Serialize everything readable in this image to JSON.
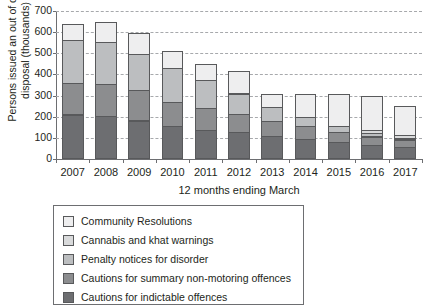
{
  "chart_data": {
    "type": "bar",
    "subtype": "stacked-vertical",
    "title": "",
    "xlabel": "12 months ending March",
    "ylabel": "Persons issued an out of court disposal (thousands)",
    "categories": [
      "2007",
      "2008",
      "2009",
      "2010",
      "2011",
      "2012",
      "2013",
      "2014",
      "2015",
      "2016",
      "2017"
    ],
    "ylim": [
      0,
      700
    ],
    "yticks": [
      0,
      100,
      200,
      300,
      400,
      500,
      600,
      700
    ],
    "ytick_labels": [
      "0",
      "100",
      "200",
      "300",
      "400",
      "500",
      "600",
      "700"
    ],
    "grid": "horizontal-dashed",
    "legend_position": "below",
    "series": [
      {
        "name": "Cautions for indictable offences",
        "color": "#6d6e71",
        "values": [
          210,
          203,
          182,
          156,
          136,
          126,
          107,
          94,
          79,
          67,
          56
        ]
      },
      {
        "name": "Cautions for summary non-motoring offences",
        "color": "#8c8d8f",
        "values": [
          154,
          156,
          146,
          118,
          107,
          90,
          77,
          64,
          53,
          43,
          36
        ]
      },
      {
        "name": "Penalty notices for disorder",
        "color": "#bcbec0",
        "values": [
          206,
          200,
          176,
          163,
          138,
          101,
          69,
          46,
          31,
          19,
          12
        ]
      },
      {
        "name": "Cannabis and khat warnings",
        "color": "#d9dadb",
        "values": [
          0,
          0,
          0,
          0,
          0,
          0,
          0,
          0,
          0,
          18,
          22
        ]
      },
      {
        "name": "Community Resolutions",
        "color": "#eeeeef",
        "values": [
          80,
          99,
          104,
          87,
          81,
          110,
          65,
          113,
          154,
          167,
          141
        ]
      }
    ]
  },
  "legend": {
    "items": [
      {
        "label": "Community Resolutions",
        "color": "#eeeeef"
      },
      {
        "label": "Cannabis and khat warnings",
        "color": "#d9dadb"
      },
      {
        "label": "Penalty notices for disorder",
        "color": "#bcbec0"
      },
      {
        "label": "Cautions for summary non-motoring offences",
        "color": "#8c8d8f"
      },
      {
        "label": "Cautions for indictable offences",
        "color": "#6d6e71"
      }
    ]
  }
}
